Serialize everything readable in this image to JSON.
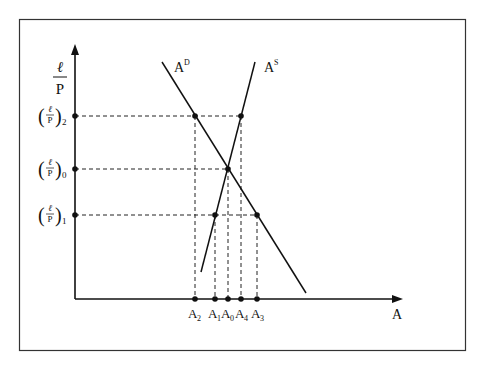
{
  "figure": {
    "y_axis_label": {
      "num": "ℓ",
      "den": "P"
    },
    "x_axis_label": "A",
    "curves": [
      {
        "name": "demand",
        "label": "A",
        "sup": "D"
      },
      {
        "name": "supply",
        "label": "A",
        "sup": "S"
      }
    ],
    "y_ticks": [
      {
        "num": "ℓ",
        "den": "P",
        "sub": "2"
      },
      {
        "num": "ℓ",
        "den": "P",
        "sub": "0"
      },
      {
        "num": "ℓ",
        "den": "P",
        "sub": "1"
      }
    ],
    "x_ticks": [
      {
        "base": "A",
        "sub": "2"
      },
      {
        "base": "A",
        "sub": "1"
      },
      {
        "base": "A",
        "sub": "0"
      },
      {
        "base": "A",
        "sub": "4"
      },
      {
        "base": "A",
        "sub": "3"
      }
    ]
  }
}
